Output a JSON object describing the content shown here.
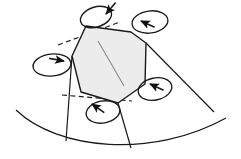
{
  "figure": {
    "caption": "",
    "background_color": "#ffffff",
    "stroke_color": "#1a1a1a",
    "grain_fill_color": "#ececec",
    "grain_inner_line_color": "#8c8c8c",
    "dashed_line_color": "#1a1a1a",
    "canvas": {
      "width": 241,
      "height": 159
    }
  },
  "grain": {
    "name": "hexagonal-grain",
    "fill": "#ececec",
    "stroke": "#1a1a1a",
    "stroke_width": 1.4,
    "vertices": [
      [
        86,
        26
      ],
      [
        131,
        32
      ],
      [
        146,
        43
      ],
      [
        145,
        84
      ],
      [
        118,
        103
      ],
      [
        81,
        92
      ],
      [
        72,
        56
      ]
    ],
    "inner_line": {
      "from": [
        98,
        41
      ],
      "to": [
        124,
        86
      ],
      "color": "#8c8c8c"
    }
  },
  "rotation_loops": [
    {
      "name": "rotation-loop-top",
      "cx": 96,
      "cy": 17,
      "rx": 16,
      "ry": 10,
      "rotate": -18,
      "arrow_at": [
        106,
        14
      ],
      "arrow_dir": 130
    },
    {
      "name": "rotation-loop-top-right",
      "cx": 150,
      "cy": 22,
      "rx": 18,
      "ry": 11,
      "rotate": -8,
      "arrow_at": [
        141,
        21
      ],
      "arrow_dir": 205
    },
    {
      "name": "rotation-loop-left",
      "cx": 52,
      "cy": 65,
      "rx": 19,
      "ry": 11,
      "rotate": -6,
      "arrow_at": [
        64,
        61
      ],
      "arrow_dir": 10
    },
    {
      "name": "rotation-loop-right",
      "cx": 155,
      "cy": 89,
      "rx": 17,
      "ry": 11,
      "rotate": -12,
      "arrow_at": [
        150,
        84
      ],
      "arrow_dir": 205
    },
    {
      "name": "rotation-loop-bottom",
      "cx": 103,
      "cy": 112,
      "rx": 17,
      "ry": 11,
      "rotate": -10,
      "arrow_at": [
        92,
        104
      ],
      "arrow_dir": 215
    }
  ],
  "dashed_axes": [
    {
      "name": "dashed-axis-upper-left",
      "from": [
        58,
        45
      ],
      "to": [
        120,
        22
      ]
    },
    {
      "name": "dashed-axis-lower-left",
      "from": [
        62,
        95
      ],
      "to": [
        132,
        101
      ]
    }
  ],
  "boundary_arc": {
    "name": "grain-boundary-arc",
    "description": "large concave-up arc spanning the lower part of the figure",
    "path": "M 16,110 C 60,150 150,158 225,120",
    "stroke": "#1a1a1a",
    "stroke_width": 1.3
  },
  "radial_lines": [
    {
      "name": "radial-line-left",
      "from": [
        72,
        56
      ],
      "to": [
        66,
        141
      ]
    },
    {
      "name": "radial-line-center",
      "from": [
        118,
        103
      ],
      "to": [
        131,
        148
      ]
    },
    {
      "name": "radial-line-right",
      "from": [
        146,
        43
      ],
      "to": [
        214,
        112
      ]
    }
  ]
}
